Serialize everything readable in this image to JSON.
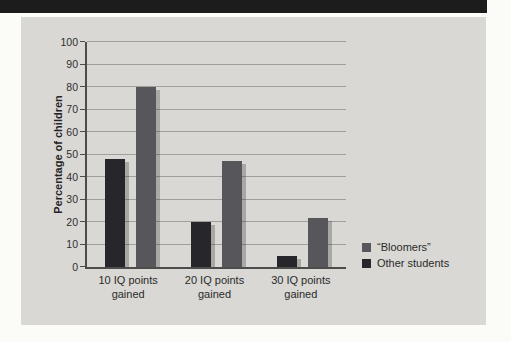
{
  "panel": {
    "background": "#d9d8d4"
  },
  "top_bar": {
    "color": "#1c1c1c"
  },
  "chart_data": {
    "type": "bar",
    "title": "",
    "xlabel": "",
    "ylabel": "Percentage of children",
    "categories": [
      "10 IQ points gained",
      "20 IQ points gained",
      "30 IQ points gained"
    ],
    "series": [
      {
        "name": "“Bloomers”",
        "color": "#57575b",
        "values": [
          80,
          47,
          22
        ]
      },
      {
        "name": "Other students",
        "color": "#26262b",
        "values": [
          48,
          20,
          5
        ]
      }
    ],
    "ylim": [
      0,
      100
    ],
    "yticks": [
      0,
      10,
      20,
      30,
      40,
      50,
      60,
      70,
      80,
      90,
      100
    ],
    "grid": "horizontal",
    "legend_position": "right-bottom",
    "gridline_color": "#a09f9c",
    "axis_color": "#4c4c4a"
  }
}
